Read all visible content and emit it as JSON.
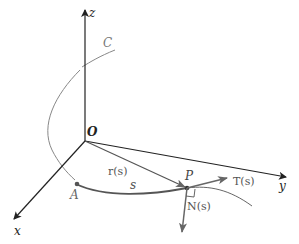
{
  "diagram": {
    "axes": {
      "z": "z",
      "x": "x",
      "y": "y",
      "origin": "O"
    },
    "curve_label": "C",
    "points": {
      "start": "A",
      "point": "P"
    },
    "arc_length_label": "s",
    "vectors": {
      "position": "r(s)",
      "tangent": "T(s)",
      "normal": "N(s)"
    },
    "colors": {
      "axis": "#222222",
      "curve": "#777777",
      "vector": "#666666",
      "label": "#555555"
    }
  }
}
